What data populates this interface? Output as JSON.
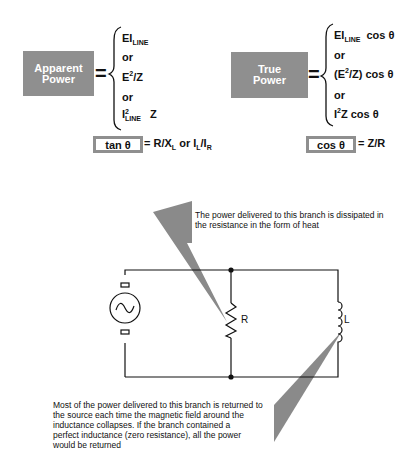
{
  "apparent_power": {
    "label_line1": "Apparent",
    "label_line2": "Power",
    "formulas": [
      {
        "main": "EI",
        "sub": "LINE"
      },
      {
        "text": "or"
      },
      {
        "main": "E",
        "sup": "2",
        "rest": "/Z"
      },
      {
        "text": "or"
      },
      {
        "main": "I",
        "sup": "2",
        "sub": "LINE",
        "rest": " Z"
      }
    ],
    "f1_main": "EI",
    "f1_sub": "LINE",
    "or1": "or",
    "f2_main": "E",
    "f2_sup": "2",
    "f2_rest": "/Z",
    "or2": "or",
    "f3_main": "I",
    "f3_sup": "2",
    "f3_sub": "LINE",
    "f3_rest": "Z"
  },
  "true_power": {
    "label_line1": "True",
    "label_line2": "Power",
    "f1_main": "EI",
    "f1_sub": "LINE",
    "f1_rest": "cos θ",
    "or1": "or",
    "f2_pre": "(E",
    "f2_sup": "2",
    "f2_rest": "/Z)  cos θ",
    "or2": "or",
    "f3_main": "I",
    "f3_sup": "2",
    "f3_rest": "Z  cos θ"
  },
  "tan_formula": {
    "box_label": "tan θ",
    "rhs_a": "= R/X",
    "rhs_a_sub": "L",
    "rhs_or": " or I",
    "rhs_b_sub": "L",
    "rhs_slash": "/I",
    "rhs_c_sub": "R"
  },
  "cos_formula": {
    "box_label": "cos θ",
    "rhs": "= Z/R"
  },
  "circuit": {
    "resistor_label": "R",
    "inductor_label": "L",
    "source": "ac-generator"
  },
  "callouts": {
    "resistance_line1": "The power delivered to this branch is dissipated in",
    "resistance_line2": "the resistance in the form of heat",
    "inductance_line1": "Most of the power delivered to this branch is returned to",
    "inductance_line2": "the source each time the magnetic field around the",
    "inductance_line3": "inductance collapses.  If the branch contained a",
    "inductance_line4": "perfect inductance (zero resistance), all the power",
    "inductance_line5": "would be returned"
  },
  "colors": {
    "box_gray": "#8f8f8f",
    "callout_gray": "#8a8a8a",
    "line": "#111111"
  }
}
